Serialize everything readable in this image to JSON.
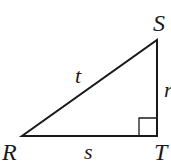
{
  "diagram": {
    "type": "right-triangle",
    "vertices": [
      {
        "name": "R",
        "label": "R",
        "x": 22,
        "y": 136
      },
      {
        "name": "S",
        "label": "S",
        "x": 157,
        "y": 40
      },
      {
        "name": "T",
        "label": "T",
        "x": 157,
        "y": 136
      }
    ],
    "sides": [
      {
        "name": "hypotenuse",
        "from": "R",
        "to": "S",
        "label": "t"
      },
      {
        "name": "base",
        "from": "R",
        "to": "T",
        "label": "s"
      },
      {
        "name": "vertical",
        "from": "T",
        "to": "S",
        "label": "r"
      }
    ],
    "right_angle_at": "T",
    "stroke_color": "#1a1a1a"
  }
}
